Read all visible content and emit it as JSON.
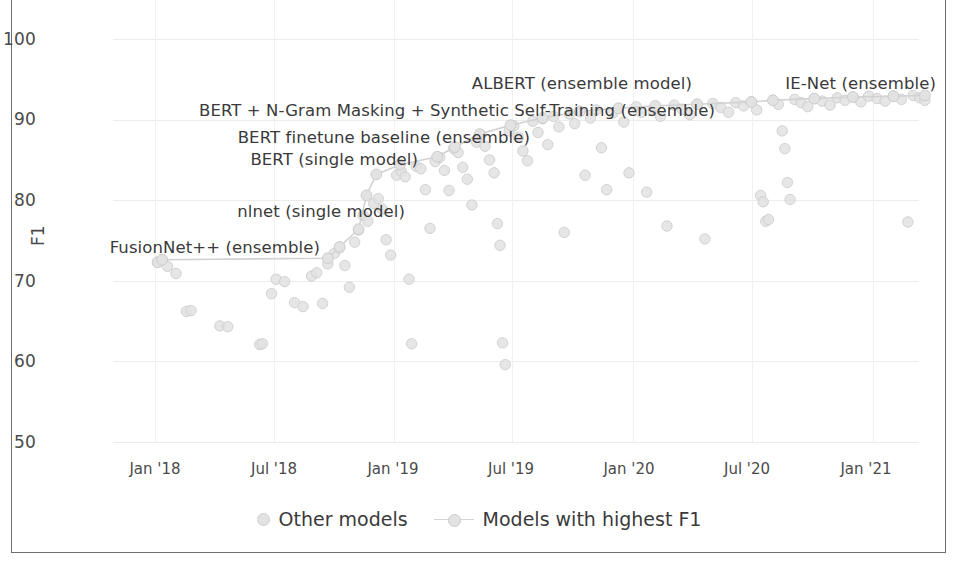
{
  "chart_data": {
    "type": "scatter",
    "title": "",
    "xlabel": "",
    "ylabel": "F1",
    "ylim": [
      50,
      100
    ],
    "yticks": [
      50,
      60,
      70,
      80,
      90,
      100
    ],
    "xticks": [
      "Jan '18",
      "Jul '18",
      "Jan '19",
      "Jul '19",
      "Jan '20",
      "Jul '20",
      "Jan '21"
    ],
    "xlim": [
      "2017-11",
      "2021-04"
    ],
    "grid": true,
    "legend_position": "bottom-center",
    "series": [
      {
        "name": "Other models",
        "marker": "circle",
        "color": "#e0e0e0",
        "points": [
          {
            "x": "2018-01-05",
            "y": 72.3
          },
          {
            "x": "2018-01-12",
            "y": 72.6
          },
          {
            "x": "2018-01-20",
            "y": 71.8
          },
          {
            "x": "2018-02-02",
            "y": 70.9
          },
          {
            "x": "2018-02-18",
            "y": 66.2
          },
          {
            "x": "2018-02-25",
            "y": 66.3
          },
          {
            "x": "2018-04-10",
            "y": 64.4
          },
          {
            "x": "2018-04-22",
            "y": 64.3
          },
          {
            "x": "2018-06-10",
            "y": 62.1
          },
          {
            "x": "2018-06-14",
            "y": 62.2
          },
          {
            "x": "2018-06-28",
            "y": 68.4
          },
          {
            "x": "2018-07-05",
            "y": 70.2
          },
          {
            "x": "2018-07-18",
            "y": 69.9
          },
          {
            "x": "2018-08-02",
            "y": 67.3
          },
          {
            "x": "2018-08-15",
            "y": 66.8
          },
          {
            "x": "2018-08-28",
            "y": 70.6
          },
          {
            "x": "2018-09-05",
            "y": 71.0
          },
          {
            "x": "2018-09-14",
            "y": 67.2
          },
          {
            "x": "2018-09-22",
            "y": 72.1
          },
          {
            "x": "2018-10-02",
            "y": 73.4
          },
          {
            "x": "2018-10-10",
            "y": 74.1
          },
          {
            "x": "2018-10-18",
            "y": 71.9
          },
          {
            "x": "2018-10-25",
            "y": 69.2
          },
          {
            "x": "2018-11-02",
            "y": 74.8
          },
          {
            "x": "2018-11-08",
            "y": 76.3
          },
          {
            "x": "2018-11-15",
            "y": 78.1
          },
          {
            "x": "2018-11-22",
            "y": 77.4
          },
          {
            "x": "2018-12-01",
            "y": 79.6
          },
          {
            "x": "2018-12-08",
            "y": 80.2
          },
          {
            "x": "2018-12-14",
            "y": 78.9
          },
          {
            "x": "2018-12-20",
            "y": 75.1
          },
          {
            "x": "2018-12-27",
            "y": 73.2
          },
          {
            "x": "2019-01-05",
            "y": 83.1
          },
          {
            "x": "2019-01-12",
            "y": 83.6
          },
          {
            "x": "2019-01-18",
            "y": 82.9
          },
          {
            "x": "2019-01-24",
            "y": 70.2
          },
          {
            "x": "2019-01-28",
            "y": 62.2
          },
          {
            "x": "2019-02-04",
            "y": 84.2
          },
          {
            "x": "2019-02-11",
            "y": 83.9
          },
          {
            "x": "2019-02-18",
            "y": 81.3
          },
          {
            "x": "2019-02-25",
            "y": 76.5
          },
          {
            "x": "2019-03-05",
            "y": 84.8
          },
          {
            "x": "2019-03-12",
            "y": 85.3
          },
          {
            "x": "2019-03-19",
            "y": 83.7
          },
          {
            "x": "2019-03-26",
            "y": 81.2
          },
          {
            "x": "2019-04-02",
            "y": 86.4
          },
          {
            "x": "2019-04-09",
            "y": 85.9
          },
          {
            "x": "2019-04-16",
            "y": 84.1
          },
          {
            "x": "2019-04-23",
            "y": 82.6
          },
          {
            "x": "2019-04-30",
            "y": 79.4
          },
          {
            "x": "2019-05-07",
            "y": 87.2
          },
          {
            "x": "2019-05-14",
            "y": 88.1
          },
          {
            "x": "2019-05-20",
            "y": 86.7
          },
          {
            "x": "2019-05-27",
            "y": 85.0
          },
          {
            "x": "2019-06-03",
            "y": 83.4
          },
          {
            "x": "2019-06-08",
            "y": 77.1
          },
          {
            "x": "2019-06-12",
            "y": 74.4
          },
          {
            "x": "2019-06-16",
            "y": 62.3
          },
          {
            "x": "2019-06-20",
            "y": 59.6
          },
          {
            "x": "2019-06-26",
            "y": 88.6
          },
          {
            "x": "2019-07-03",
            "y": 89.2
          },
          {
            "x": "2019-07-10",
            "y": 87.8
          },
          {
            "x": "2019-07-17",
            "y": 86.1
          },
          {
            "x": "2019-07-24",
            "y": 84.9
          },
          {
            "x": "2019-08-01",
            "y": 89.8
          },
          {
            "x": "2019-08-09",
            "y": 88.4
          },
          {
            "x": "2019-08-16",
            "y": 90.1
          },
          {
            "x": "2019-08-24",
            "y": 86.9
          },
          {
            "x": "2019-09-02",
            "y": 90.4
          },
          {
            "x": "2019-09-10",
            "y": 89.1
          },
          {
            "x": "2019-09-18",
            "y": 76.0
          },
          {
            "x": "2019-09-26",
            "y": 90.7
          },
          {
            "x": "2019-10-04",
            "y": 89.5
          },
          {
            "x": "2019-10-12",
            "y": 91.0
          },
          {
            "x": "2019-10-20",
            "y": 83.1
          },
          {
            "x": "2019-10-28",
            "y": 90.2
          },
          {
            "x": "2019-11-06",
            "y": 91.2
          },
          {
            "x": "2019-11-14",
            "y": 86.5
          },
          {
            "x": "2019-11-22",
            "y": 81.3
          },
          {
            "x": "2019-12-01",
            "y": 90.8
          },
          {
            "x": "2019-12-10",
            "y": 91.4
          },
          {
            "x": "2019-12-18",
            "y": 89.7
          },
          {
            "x": "2019-12-26",
            "y": 83.4
          },
          {
            "x": "2020-01-06",
            "y": 91.6
          },
          {
            "x": "2020-01-14",
            "y": 90.9
          },
          {
            "x": "2020-01-22",
            "y": 81.0
          },
          {
            "x": "2020-02-01",
            "y": 91.1
          },
          {
            "x": "2020-02-12",
            "y": 90.4
          },
          {
            "x": "2020-02-22",
            "y": 76.8
          },
          {
            "x": "2020-03-04",
            "y": 91.8
          },
          {
            "x": "2020-03-16",
            "y": 91.3
          },
          {
            "x": "2020-03-28",
            "y": 90.6
          },
          {
            "x": "2020-04-08",
            "y": 91.9
          },
          {
            "x": "2020-04-20",
            "y": 75.2
          },
          {
            "x": "2020-05-02",
            "y": 92.0
          },
          {
            "x": "2020-05-14",
            "y": 91.5
          },
          {
            "x": "2020-05-26",
            "y": 90.9
          },
          {
            "x": "2020-06-06",
            "y": 92.1
          },
          {
            "x": "2020-06-18",
            "y": 91.7
          },
          {
            "x": "2020-06-30",
            "y": 92.2
          },
          {
            "x": "2020-07-08",
            "y": 91.2
          },
          {
            "x": "2020-07-14",
            "y": 80.6
          },
          {
            "x": "2020-07-18",
            "y": 79.8
          },
          {
            "x": "2020-07-22",
            "y": 77.4
          },
          {
            "x": "2020-07-26",
            "y": 77.6
          },
          {
            "x": "2020-08-02",
            "y": 92.4
          },
          {
            "x": "2020-08-10",
            "y": 91.9
          },
          {
            "x": "2020-08-16",
            "y": 88.6
          },
          {
            "x": "2020-08-20",
            "y": 86.4
          },
          {
            "x": "2020-08-24",
            "y": 82.2
          },
          {
            "x": "2020-08-28",
            "y": 80.1
          },
          {
            "x": "2020-09-04",
            "y": 92.5
          },
          {
            "x": "2020-09-14",
            "y": 92.1
          },
          {
            "x": "2020-09-24",
            "y": 91.6
          },
          {
            "x": "2020-10-04",
            "y": 92.6
          },
          {
            "x": "2020-10-16",
            "y": 92.3
          },
          {
            "x": "2020-10-28",
            "y": 91.8
          },
          {
            "x": "2020-11-08",
            "y": 92.7
          },
          {
            "x": "2020-11-20",
            "y": 92.4
          },
          {
            "x": "2020-12-02",
            "y": 92.8
          },
          {
            "x": "2020-12-14",
            "y": 92.2
          },
          {
            "x": "2020-12-26",
            "y": 92.9
          },
          {
            "x": "2021-01-08",
            "y": 92.6
          },
          {
            "x": "2021-01-20",
            "y": 92.3
          },
          {
            "x": "2021-02-02",
            "y": 92.9
          },
          {
            "x": "2021-02-14",
            "y": 92.5
          },
          {
            "x": "2021-02-24",
            "y": 77.3
          },
          {
            "x": "2021-03-04",
            "y": 93.0
          },
          {
            "x": "2021-03-14",
            "y": 92.7
          },
          {
            "x": "2021-03-22",
            "y": 92.4
          }
        ]
      },
      {
        "name": "Models with highest F1",
        "marker": "circle-line",
        "color": "#d0d0d0",
        "points": [
          {
            "x": "2018-01-05",
            "y": 72.3
          },
          {
            "x": "2018-01-12",
            "y": 72.6
          },
          {
            "x": "2018-09-22",
            "y": 72.8
          },
          {
            "x": "2018-10-10",
            "y": 74.2
          },
          {
            "x": "2018-11-08",
            "y": 76.4
          },
          {
            "x": "2018-11-20",
            "y": 80.6
          },
          {
            "x": "2018-12-05",
            "y": 83.2
          },
          {
            "x": "2019-01-10",
            "y": 84.4
          },
          {
            "x": "2019-03-08",
            "y": 85.4
          },
          {
            "x": "2019-04-04",
            "y": 86.6
          },
          {
            "x": "2019-05-12",
            "y": 88.2
          },
          {
            "x": "2019-06-28",
            "y": 89.3
          },
          {
            "x": "2019-08-16",
            "y": 90.2
          },
          {
            "x": "2019-10-12",
            "y": 91.0
          },
          {
            "x": "2019-12-10",
            "y": 91.4
          },
          {
            "x": "2020-02-04",
            "y": 91.7
          },
          {
            "x": "2020-04-08",
            "y": 91.9
          },
          {
            "x": "2020-06-30",
            "y": 92.2
          },
          {
            "x": "2020-08-02",
            "y": 92.4
          },
          {
            "x": "2020-10-04",
            "y": 92.6
          },
          {
            "x": "2020-12-02",
            "y": 92.8
          },
          {
            "x": "2021-02-02",
            "y": 92.9
          },
          {
            "x": "2021-03-22",
            "y": 93.0
          }
        ]
      }
    ],
    "annotations": [
      {
        "label": "ALBERT (ensemble model)",
        "x_px": 692,
        "y_px": 83,
        "align": "right"
      },
      {
        "label": "IE-Net (ensemble)",
        "x_px": 936,
        "y_px": 83,
        "align": "right"
      },
      {
        "label": "BERT + N-Gram Masking + Synthetic Self-Training (ensemble)",
        "x_px": 715,
        "y_px": 110,
        "align": "right"
      },
      {
        "label": "BERT finetune baseline (ensemble)",
        "x_px": 530,
        "y_px": 137,
        "align": "right"
      },
      {
        "label": "BERT (single model)",
        "x_px": 418,
        "y_px": 159,
        "align": "right"
      },
      {
        "label": "nlnet (single model)",
        "x_px": 405,
        "y_px": 211,
        "align": "right"
      },
      {
        "label": "FusionNet++ (ensemble)",
        "x_px": 320,
        "y_px": 247,
        "align": "right"
      }
    ]
  },
  "axes": {
    "y_label": "F1",
    "y_ticks": [
      "100",
      "90",
      "80",
      "70",
      "60",
      "50"
    ],
    "x_ticks": [
      "Jan '18",
      "Jul '18",
      "Jan '19",
      "Jul '19",
      "Jan '20",
      "Jul '20",
      "Jan '21"
    ]
  },
  "legend": {
    "items": [
      {
        "label": "Other models",
        "marker": "dot"
      },
      {
        "label": "Models with highest F1",
        "marker": "line-dot"
      }
    ]
  },
  "colors": {
    "marker_fill": "#e2e2e2",
    "marker_edge": "#cdcdcd",
    "line": "#d2d2d2",
    "grid": "#ececec",
    "text": "#3b3b3b",
    "frame": "#6f6f6f"
  }
}
